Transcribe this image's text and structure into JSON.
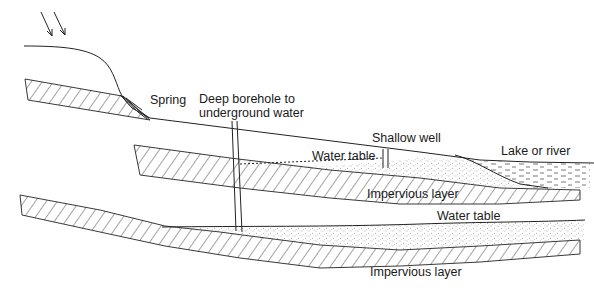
{
  "diagram": {
    "type": "cross-section",
    "labels": {
      "spring": "Spring",
      "borehole_line1": "Deep borehole to",
      "borehole_line2": "underground water",
      "shallow_well": "Shallow well",
      "water_table_upper": "Water table",
      "lake_or_river": "Lake or river",
      "impervious_upper": "Impervious layer",
      "water_table_lower": "Water table",
      "impervious_lower": "Impervious layer"
    },
    "elements": [
      {
        "id": "rain-arrows",
        "description": "Two diagonal arrows indicating rainfall"
      },
      {
        "id": "ground-surface",
        "description": "Hill slope descending to the right"
      },
      {
        "id": "spring",
        "description": "Water emerging where upper hatched layer meets slope"
      },
      {
        "id": "deep-borehole",
        "description": "Vertical pipe through upper aquifer into lower aquifer"
      },
      {
        "id": "shallow-well",
        "description": "Short pipe into upper water table"
      },
      {
        "id": "upper-aquifer",
        "description": "Stippled saturated zone above upper impervious layer"
      },
      {
        "id": "lake",
        "description": "Dashed water body at right"
      },
      {
        "id": "lower-aquifer",
        "description": "Stippled saturated zone above lower impervious layer"
      }
    ],
    "colors": {
      "line": "#222222",
      "background": "#ffffff"
    }
  }
}
